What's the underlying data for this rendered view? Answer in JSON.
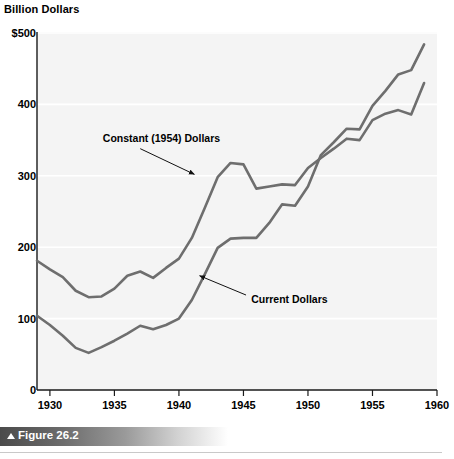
{
  "figure": {
    "caption": "Figure 26.2",
    "caption_marker": "triangle-up-icon"
  },
  "chart_data": {
    "type": "line",
    "title": "Billion Dollars",
    "xlabel": "",
    "ylabel": "Billion Dollars",
    "xlim": [
      1929,
      1960
    ],
    "ylim": [
      0,
      500
    ],
    "xticks": [
      1930,
      1935,
      1940,
      1945,
      1950,
      1955,
      1960
    ],
    "xtick_labels": [
      "1930",
      "1935",
      "1940",
      "1945",
      "1950",
      "1955",
      "1960"
    ],
    "yticks": [
      0,
      100,
      200,
      300,
      400,
      500
    ],
    "ytick_labels": [
      "0",
      "100",
      "200",
      "300",
      "400",
      "$500"
    ],
    "grid": "horizontal-light",
    "legend": "inline-annotations",
    "line_color": "#6e6e6e",
    "series": [
      {
        "name": "Constant (1954) Dollars",
        "label_x": 1934.1,
        "label_y": 352,
        "arrow_from": [
          1937.0,
          338
        ],
        "arrow_to": [
          1941.2,
          302
        ],
        "x": [
          1929,
          1930,
          1931,
          1932,
          1933,
          1934,
          1935,
          1936,
          1937,
          1938,
          1939,
          1940,
          1941,
          1942,
          1943,
          1944,
          1945,
          1946,
          1947,
          1948,
          1949,
          1950,
          1951,
          1952,
          1953,
          1954,
          1955,
          1956,
          1957,
          1958,
          1959
        ],
        "values": [
          181,
          169,
          158,
          139,
          130,
          131,
          142,
          160,
          166,
          157,
          171,
          184,
          213,
          255,
          298,
          318,
          316,
          282,
          285,
          288,
          287,
          311,
          325,
          338,
          352,
          350,
          378,
          387,
          392,
          386,
          430
        ]
      },
      {
        "name": "Current Dollars",
        "label_x": 1945.6,
        "label_y": 126,
        "arrow_from": [
          1945.2,
          133
        ],
        "arrow_to": [
          1941.6,
          160
        ],
        "x": [
          1929,
          1930,
          1931,
          1932,
          1933,
          1934,
          1935,
          1936,
          1937,
          1938,
          1939,
          1940,
          1941,
          1942,
          1943,
          1944,
          1945,
          1946,
          1947,
          1948,
          1949,
          1950,
          1951,
          1952,
          1953,
          1954,
          1955,
          1956,
          1957,
          1958,
          1959
        ],
        "values": [
          104,
          91,
          76,
          59,
          52,
          60,
          69,
          79,
          90,
          85,
          91,
          100,
          126,
          162,
          199,
          212,
          213,
          213,
          234,
          260,
          258,
          285,
          329,
          347,
          366,
          365,
          398,
          419,
          442,
          448,
          484
        ]
      }
    ]
  }
}
